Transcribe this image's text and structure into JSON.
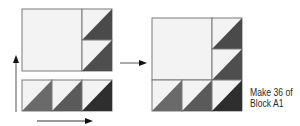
{
  "caption": {
    "line1": "Make 36 of",
    "line2": "Block A1"
  },
  "colors": {
    "light": "#f3f3f3",
    "outline": "#7a7a7a",
    "dark_top": "#4a4a4a",
    "dark_mid": "#4e4e4e",
    "strip_1": "#6a6a6a",
    "strip_2": "#5a5a5a",
    "strip_3": "#2e2e2e",
    "arrow": "#222222"
  },
  "diagram": {
    "left_assembly": {
      "top_unit": {
        "large_square": 1,
        "hst_column": 2
      },
      "bottom_strip": {
        "hst_count": 3
      }
    },
    "right_block": {
      "large_square": 1,
      "hst_right_column": 2,
      "hst_bottom_row": 3
    },
    "arrows": [
      "up-arrow",
      "right-arrow-bottom",
      "right-arrow-middle"
    ]
  }
}
